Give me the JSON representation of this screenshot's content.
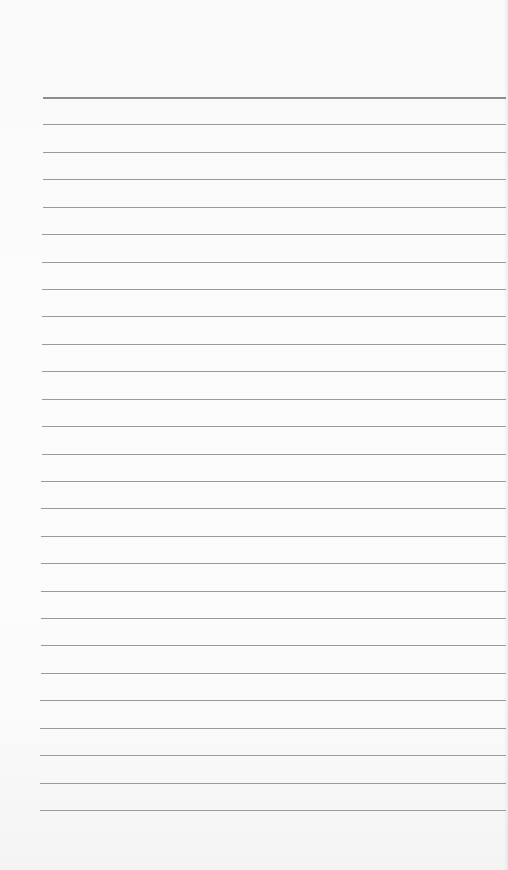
{
  "page": {
    "type": "lined-paper",
    "background_color": "#fafafa",
    "line_color": "#9a9a9a",
    "line_count": 27,
    "first_line_y": 97,
    "last_line_y": 810,
    "line_left_x_top": 43,
    "line_left_x_bottom": 40,
    "line_right_x": 506
  }
}
